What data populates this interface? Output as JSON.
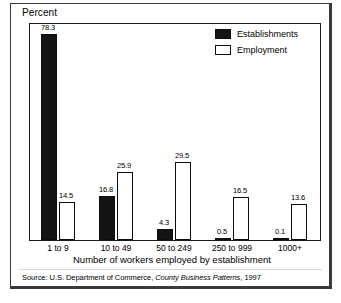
{
  "chart_data": {
    "type": "bar",
    "title": "",
    "ylabel": "Percent",
    "xlabel": "Number of workers employed by establishment",
    "categories": [
      "1 to 9",
      "10 to 49",
      "50 to 249",
      "250 to 999",
      "1000+"
    ],
    "series": [
      {
        "name": "Establishments",
        "values": [
          78.3,
          16.8,
          4.3,
          0.5,
          0.1
        ],
        "color": "#141414"
      },
      {
        "name": "Employment",
        "values": [
          14.5,
          25.9,
          29.5,
          16.5,
          13.6
        ],
        "color": "#ffffff"
      }
    ],
    "value_labels": {
      "establishments": [
        "78.3",
        "16.8",
        "4.3",
        "0.5",
        "0.1"
      ],
      "employment": [
        "14.5",
        "25.9",
        "29.5",
        "16.5",
        "13.6"
      ]
    },
    "ylim": [
      0,
      82
    ],
    "grid": false,
    "legend_position": "top-right",
    "legend": [
      "Establishments",
      "Employment"
    ]
  },
  "source": {
    "prefix": "Source: U.S. Department of Commerce, ",
    "publication": "County Business Patterns",
    "suffix": ", 1997"
  }
}
